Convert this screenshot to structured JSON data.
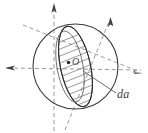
{
  "figure": {
    "type": "diagram",
    "title": "",
    "background_color": "#ffffff",
    "stroke_color": "#3a3a3a",
    "axis_color": "#8c8c8c",
    "hatch_color": "#7a7a7a",
    "width": 148,
    "height": 133
  },
  "labels": {
    "area_element": "da",
    "origin": "O"
  },
  "geometry": {
    "sphere": {
      "center_x": 75.5,
      "center_y": 66.5,
      "radius": 42.5
    },
    "disk": {
      "center_x": 75.5,
      "center_y": 66.5,
      "semi_major": 41,
      "semi_minor": 15,
      "rotation_deg": 78,
      "hatch_spacing": 7,
      "hatch_angle_deg": 22
    },
    "axes": [
      {
        "name": "vertical-axis",
        "x1": 54,
        "y1": 130,
        "x2": 54,
        "y2": 4,
        "dashed": true,
        "arrow_at": "end"
      },
      {
        "name": "horizontal-axis",
        "x1": 6,
        "y1": 68,
        "x2": 142,
        "y2": 68,
        "dashed": true,
        "arrow_at": "start"
      },
      {
        "name": "diagonal-axis-ne",
        "x1": 22,
        "y1": 24,
        "x2": 130,
        "y2": 76,
        "dashed": true,
        "arrow_at": "end"
      },
      {
        "name": "diagonal-axis-tilted",
        "x1": 64,
        "y1": 128,
        "x2": 112,
        "y2": 16,
        "dashed": true,
        "arrow_at": "end"
      }
    ],
    "arrows": [
      {
        "name": "arrow-up",
        "tip_x": 54,
        "tip_y": 4,
        "angle_deg": -90
      },
      {
        "name": "arrow-left",
        "tip_x": 6,
        "tip_y": 68,
        "angle_deg": 180
      },
      {
        "name": "arrow-right",
        "tip_x": 142,
        "tip_y": 72,
        "angle_deg": 22
      },
      {
        "name": "arrow-upright",
        "tip_x": 111,
        "tip_y": 17,
        "angle_deg": -66
      }
    ],
    "leader_line": {
      "name": "leader-to-da",
      "x1": 84,
      "y1": 72,
      "x2": 116,
      "y2": 94
    }
  }
}
